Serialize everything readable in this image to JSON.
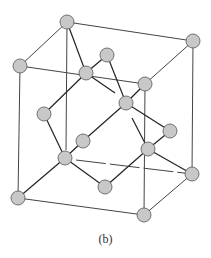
{
  "figure": {
    "caption": "(b)",
    "atom_color": "#c8c8c8",
    "line_color": "#333333",
    "atoms": [
      {
        "id": "a1",
        "x": 67,
        "y": 22
      },
      {
        "id": "a2",
        "x": 193,
        "y": 41
      },
      {
        "id": "a3",
        "x": 20,
        "y": 66
      },
      {
        "id": "a4",
        "x": 145,
        "y": 84
      },
      {
        "id": "a5",
        "x": 86,
        "y": 73
      },
      {
        "id": "a6",
        "x": 107,
        "y": 55
      },
      {
        "id": "a7",
        "x": 126,
        "y": 103
      },
      {
        "id": "a8",
        "x": 44,
        "y": 114
      },
      {
        "id": "a9",
        "x": 170,
        "y": 131
      },
      {
        "id": "a10",
        "x": 83,
        "y": 141
      },
      {
        "id": "a11",
        "x": 65,
        "y": 158
      },
      {
        "id": "a12",
        "x": 148,
        "y": 149
      },
      {
        "id": "a13",
        "x": 105,
        "y": 187
      },
      {
        "id": "a14",
        "x": 192,
        "y": 174
      },
      {
        "id": "a15",
        "x": 18,
        "y": 198
      },
      {
        "id": "a16",
        "x": 144,
        "y": 215
      }
    ]
  }
}
